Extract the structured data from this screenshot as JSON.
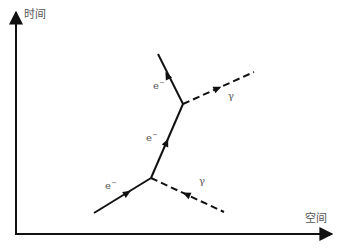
{
  "diagram": {
    "type": "feynman-diagram",
    "colors": {
      "line": "#111111",
      "label": "#555555",
      "background": "#ffffff"
    },
    "axes": {
      "y_label": "时间",
      "x_label": "空间"
    },
    "vertices": [
      {
        "id": "v1",
        "x": 151,
        "y": 178
      },
      {
        "id": "v2",
        "x": 183,
        "y": 104
      }
    ],
    "propagators": [
      {
        "id": "electron-in",
        "kind": "fermion",
        "from": [
          94,
          213
        ],
        "to": [
          151,
          178
        ],
        "label": "e",
        "label_sup": "−"
      },
      {
        "id": "photon-in",
        "kind": "photon",
        "from": [
          224,
          212
        ],
        "to": [
          151,
          178
        ],
        "label": "γ"
      },
      {
        "id": "electron-internal",
        "kind": "fermion",
        "from": [
          151,
          178
        ],
        "to": [
          183,
          104
        ],
        "label": "e",
        "label_sup": "−"
      },
      {
        "id": "photon-out",
        "kind": "photon",
        "from": [
          183,
          104
        ],
        "to": [
          254,
          72
        ],
        "label": "γ"
      },
      {
        "id": "electron-out",
        "kind": "fermion",
        "from": [
          183,
          104
        ],
        "to": [
          158,
          54
        ],
        "label": "e",
        "label_sup": "−"
      }
    ]
  }
}
